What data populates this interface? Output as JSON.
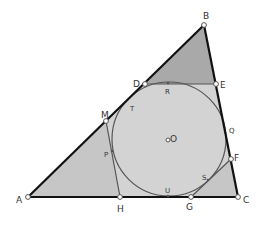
{
  "diagram": {
    "type": "geometry-construction",
    "colors": {
      "fill_main": "#d3d3d3",
      "fill_corner_B": "#a9a9a9",
      "fill_corner_A": "#c6c6c6",
      "fill_corner_C": "#c6c6c6",
      "triangle_stroke": "#111111",
      "thin_stroke": "#555555",
      "circle_stroke": "#555555",
      "point_fill": "#ffffff",
      "label": "#333333"
    },
    "points": [
      {
        "id": "A",
        "label": "A",
        "kind": "vertex"
      },
      {
        "id": "B",
        "label": "B",
        "kind": "vertex"
      },
      {
        "id": "C",
        "label": "C",
        "kind": "vertex"
      },
      {
        "id": "D",
        "label": "D",
        "kind": "side-point"
      },
      {
        "id": "E",
        "label": "E",
        "kind": "side-point"
      },
      {
        "id": "M",
        "label": "M",
        "kind": "side-point"
      },
      {
        "id": "H",
        "label": "H",
        "kind": "side-point"
      },
      {
        "id": "F",
        "label": "F",
        "kind": "side-point"
      },
      {
        "id": "G",
        "label": "G",
        "kind": "side-point"
      },
      {
        "id": "R",
        "label": "R",
        "kind": "tangent-point"
      },
      {
        "id": "T",
        "label": "T",
        "kind": "tangent-point"
      },
      {
        "id": "P",
        "label": "P",
        "kind": "tangent-point"
      },
      {
        "id": "Q",
        "label": "Q",
        "kind": "tangent-point"
      },
      {
        "id": "S",
        "label": "S",
        "kind": "tangent-point"
      },
      {
        "id": "U",
        "label": "U",
        "kind": "tangent-point"
      },
      {
        "id": "O",
        "label": "O",
        "kind": "center"
      }
    ],
    "segments": [
      {
        "from": "A",
        "to": "B",
        "style": "thick"
      },
      {
        "from": "B",
        "to": "C",
        "style": "thick"
      },
      {
        "from": "A",
        "to": "C",
        "style": "thick"
      },
      {
        "from": "D",
        "to": "E",
        "style": "thin"
      },
      {
        "from": "M",
        "to": "H",
        "style": "thin"
      },
      {
        "from": "F",
        "to": "G",
        "style": "thin"
      }
    ],
    "circle": {
      "center": "O",
      "label": "incircle"
    }
  }
}
